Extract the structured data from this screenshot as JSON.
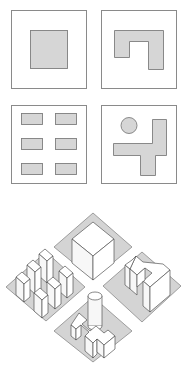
{
  "figure": {
    "plans": [
      {
        "id": "single-block",
        "label": "Single central block"
      },
      {
        "id": "u-shaped-block",
        "label": "U-shaped / hook block"
      },
      {
        "id": "six-pavilions",
        "label": "Six detached pavilions"
      },
      {
        "id": "cross-and-tower",
        "label": "Cross-shaped block with circular tower"
      }
    ],
    "axonometric": {
      "label": "Axonometric of the four blocks arranged around an intersection"
    },
    "caption_fragment": "",
    "colors": {
      "background": "#ffffff",
      "footprint_fill": "#d6d6d6",
      "ground_fill": "#d4d4d4",
      "stroke": "#8a8a8a",
      "building_face": "#ffffff"
    }
  }
}
